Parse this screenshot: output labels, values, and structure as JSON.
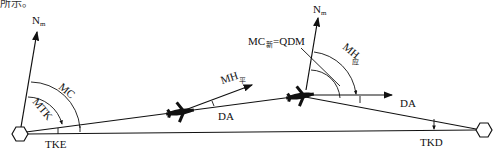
{
  "caption_fragment": "所示。",
  "labels": {
    "north_left": "N",
    "north_left_sub": "m",
    "north_right": "N",
    "north_right_sub": "m",
    "mc": "MC",
    "mtk": "MTK",
    "tke": "TKE",
    "mh_avg": "MH",
    "mh_avg_sub": "平",
    "da_left": "DA",
    "mc_new": "MC",
    "mc_new_sub": "新",
    "mc_new_eq": "=QDM",
    "mh_should": "MH",
    "mh_should_sub": "应",
    "da_right": "DA",
    "tkd": "TKD"
  },
  "colors": {
    "stroke": "#111111",
    "background": "#ffffff"
  }
}
